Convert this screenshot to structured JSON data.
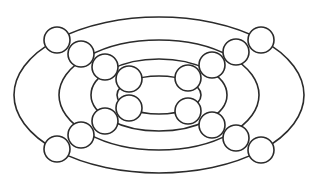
{
  "diagram": {
    "type": "concentric-ellipses-with-nodes",
    "canvas": {
      "width": 313,
      "height": 190,
      "background": "#ffffff"
    },
    "stroke_color": "#2b2b2b",
    "center": {
      "x": 159,
      "y": 95
    },
    "ellipses": [
      {
        "id": "ring-1",
        "rx": 145,
        "ry": 78
      },
      {
        "id": "ring-2",
        "rx": 100,
        "ry": 55
      },
      {
        "id": "ring-3",
        "rx": 68,
        "ry": 36
      },
      {
        "id": "ring-4",
        "rx": 42,
        "ry": 19
      }
    ],
    "node_radius": 13,
    "nodes": [
      {
        "id": "tl-1",
        "x": 57,
        "y": 40
      },
      {
        "id": "tl-2",
        "x": 81,
        "y": 54
      },
      {
        "id": "tl-3",
        "x": 105,
        "y": 67
      },
      {
        "id": "tl-4",
        "x": 129,
        "y": 79
      },
      {
        "id": "tr-1",
        "x": 261,
        "y": 40
      },
      {
        "id": "tr-2",
        "x": 236,
        "y": 52
      },
      {
        "id": "tr-3",
        "x": 212,
        "y": 65
      },
      {
        "id": "tr-4",
        "x": 188,
        "y": 78
      },
      {
        "id": "bl-1",
        "x": 57,
        "y": 149
      },
      {
        "id": "bl-2",
        "x": 81,
        "y": 135
      },
      {
        "id": "bl-3",
        "x": 105,
        "y": 121
      },
      {
        "id": "bl-4",
        "x": 129,
        "y": 108
      },
      {
        "id": "br-1",
        "x": 261,
        "y": 150
      },
      {
        "id": "br-2",
        "x": 236,
        "y": 138
      },
      {
        "id": "br-3",
        "x": 212,
        "y": 125
      },
      {
        "id": "br-4",
        "x": 188,
        "y": 111
      }
    ]
  }
}
